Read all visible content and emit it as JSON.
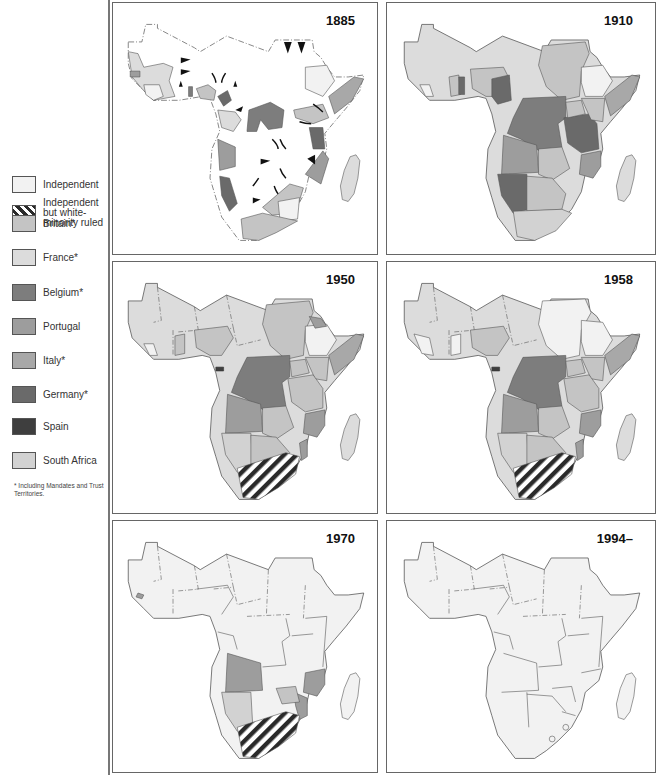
{
  "legend": {
    "items": [
      {
        "label": "Independent",
        "color": "#f2f2f2",
        "pattern": "none"
      },
      {
        "label": "Independent but white-minority ruled",
        "color": "#ffffff",
        "pattern": "diagonal-stripes"
      },
      {
        "label": "Britain*",
        "color": "#c4c4c4",
        "pattern": "none"
      },
      {
        "label": "France*",
        "color": "#dcdcdc",
        "pattern": "none"
      },
      {
        "label": "Belgium*",
        "color": "#7d7d7d",
        "pattern": "none"
      },
      {
        "label": "Portugal",
        "color": "#9d9d9d",
        "pattern": "none"
      },
      {
        "label": "Italy*",
        "color": "#a8a8a8",
        "pattern": "none"
      },
      {
        "label": "Germany*",
        "color": "#6a6a6a",
        "pattern": "none"
      },
      {
        "label": "Spain",
        "color": "#3e3e3e",
        "pattern": "none"
      },
      {
        "label": "South Africa",
        "color": "#d2d2d2",
        "pattern": "none"
      }
    ],
    "footnote": "* Including Mandates and Trust Territories."
  },
  "panels": [
    {
      "year": "1885"
    },
    {
      "year": "1910"
    },
    {
      "year": "1950"
    },
    {
      "year": "1958"
    },
    {
      "year": "1970"
    },
    {
      "year": "1994–"
    }
  ],
  "colors": {
    "independent": "#f2f2f2",
    "britain": "#c4c4c4",
    "france": "#dcdcdc",
    "belgium": "#7d7d7d",
    "portugal": "#9d9d9d",
    "italy": "#a8a8a8",
    "germany": "#6a6a6a",
    "spain": "#3e3e3e",
    "south_africa": "#d2d2d2",
    "border": "#555555"
  }
}
